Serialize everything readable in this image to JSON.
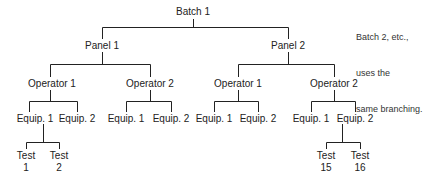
{
  "diagram": {
    "root": "Batch 1",
    "panels": [
      "Panel 1",
      "Panel 2"
    ],
    "operators": [
      "Operator 1",
      "Operator 2",
      "Operator 1",
      "Operator 2"
    ],
    "equipment": [
      "Equip. 1",
      "Equip. 2",
      "Equip. 1",
      "Equip. 2",
      "Equip. 1",
      "Equip. 2",
      "Equip. 1",
      "Equip. 2"
    ],
    "tests": [
      {
        "line1": "Test",
        "line2": "1"
      },
      {
        "line1": "Test",
        "line2": "2"
      },
      {
        "line1": "Test",
        "line2": "15"
      },
      {
        "line1": "Test",
        "line2": "16"
      }
    ],
    "note": [
      "Batch 2, etc.,",
      "uses the",
      "same branching."
    ]
  },
  "colors": {
    "line": "#222222",
    "text": "#222222",
    "background": "#ffffff"
  }
}
